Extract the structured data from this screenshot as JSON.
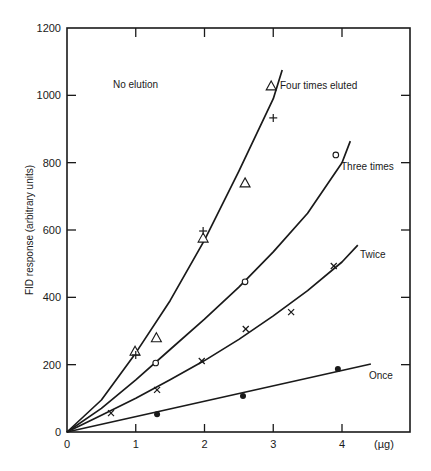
{
  "chart_data": {
    "type": "scatter",
    "title": "",
    "xlabel": "(µg)",
    "ylabel": "FID response (arbitrary units)",
    "xlim": [
      0,
      5
    ],
    "ylim": [
      0,
      1200
    ],
    "x_ticks": [
      0,
      1,
      2,
      3,
      4
    ],
    "y_ticks": [
      0,
      200,
      400,
      600,
      800,
      1000,
      1200
    ],
    "grid": false,
    "legend": "inline labels next to curves",
    "annotations": [
      {
        "text": "No elution",
        "x": 1.1,
        "y": 1050
      },
      {
        "text": "Four times eluted",
        "x": 3.1,
        "y": 1000
      },
      {
        "text": "Three times",
        "x": 4.0,
        "y": 800
      },
      {
        "text": "Twice",
        "x": 4.3,
        "y": 575
      },
      {
        "text": "Once",
        "x": 4.3,
        "y": 175
      }
    ],
    "series": [
      {
        "name": "Four times eluted",
        "marker": "triangle",
        "points": [
          [
            0.99,
            240
          ],
          [
            1.3,
            280
          ],
          [
            1.98,
            576
          ],
          [
            2.59,
            740
          ],
          [
            2.97,
            1028
          ]
        ],
        "curve": [
          [
            0,
            0
          ],
          [
            0.5,
            95
          ],
          [
            1.0,
            235
          ],
          [
            1.5,
            390
          ],
          [
            2.0,
            570
          ],
          [
            2.5,
            775
          ],
          [
            3.0,
            990
          ],
          [
            3.13,
            1075
          ]
        ]
      },
      {
        "name": "No elution",
        "marker": "plus",
        "points": [
          [
            1.0,
            229
          ],
          [
            1.98,
            597
          ],
          [
            3.0,
            933
          ]
        ]
      },
      {
        "name": "Three times",
        "marker": "circle-open",
        "points": [
          [
            1.29,
            205
          ],
          [
            2.59,
            446
          ],
          [
            3.91,
            823
          ]
        ],
        "curve": [
          [
            0,
            0
          ],
          [
            0.5,
            70
          ],
          [
            1.0,
            155
          ],
          [
            1.5,
            245
          ],
          [
            2.0,
            335
          ],
          [
            2.5,
            430
          ],
          [
            3.0,
            535
          ],
          [
            3.5,
            650
          ],
          [
            4.0,
            800
          ],
          [
            4.12,
            864
          ]
        ]
      },
      {
        "name": "Twice",
        "marker": "x",
        "points": [
          [
            0.64,
            56
          ],
          [
            1.31,
            125
          ],
          [
            1.96,
            211
          ],
          [
            2.6,
            306
          ],
          [
            3.26,
            356
          ],
          [
            3.88,
            493
          ]
        ],
        "curve": [
          [
            0,
            0
          ],
          [
            0.5,
            50
          ],
          [
            1.0,
            100
          ],
          [
            1.5,
            155
          ],
          [
            2.0,
            212
          ],
          [
            2.5,
            275
          ],
          [
            3.0,
            345
          ],
          [
            3.5,
            420
          ],
          [
            4.0,
            505
          ],
          [
            4.23,
            555
          ]
        ]
      },
      {
        "name": "Once",
        "marker": "circle-filled",
        "points": [
          [
            1.31,
            53
          ],
          [
            2.56,
            107
          ],
          [
            3.94,
            187
          ]
        ],
        "curve": [
          [
            0,
            0
          ],
          [
            4.42,
            202
          ]
        ]
      }
    ]
  },
  "axes": {
    "x_tick_labels": [
      "0",
      "1",
      "2",
      "3",
      "4"
    ],
    "x_unit_label": "(µg)",
    "y_tick_labels": [
      "0",
      "200",
      "400",
      "600",
      "800",
      "1000",
      "1200"
    ],
    "y_title": "FID response (arbitrary units)"
  },
  "labels": {
    "no_elution": "No elution",
    "four_times": "Four times eluted",
    "three_times": "Three times",
    "twice": "Twice",
    "once": "Once"
  },
  "colors": {
    "ink": "#1a1a1a",
    "background": "#ffffff"
  }
}
